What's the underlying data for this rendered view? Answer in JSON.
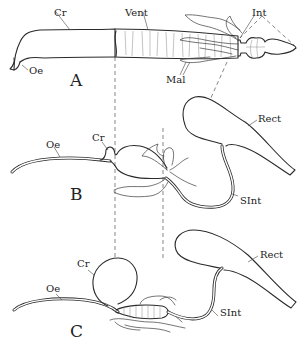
{
  "figure": {
    "panels": [
      {
        "id": "A",
        "letter": "A",
        "labels": {
          "crop": "Cr",
          "ventriculus": "Vent",
          "intestine": "Int",
          "malpighian": "Mal",
          "oesophagus": "Oe"
        }
      },
      {
        "id": "B",
        "letter": "B",
        "labels": {
          "crop": "Cr",
          "oesophagus": "Oe",
          "rectum": "Rect",
          "small_intestine": "SInt"
        }
      },
      {
        "id": "C",
        "letter": "C",
        "labels": {
          "crop": "Cr",
          "oesophagus": "Oe",
          "rectum": "Rect",
          "small_intestine": "SInt"
        }
      }
    ],
    "colors": {
      "ink": "#2a2a2a",
      "background": "#ffffff"
    }
  }
}
